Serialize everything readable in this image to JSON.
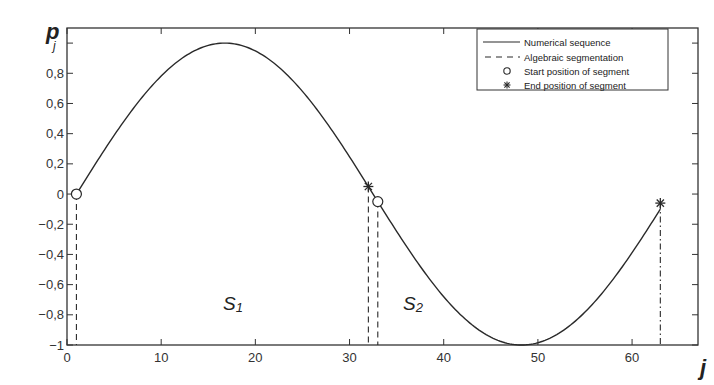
{
  "chart_data": {
    "type": "line",
    "title": "",
    "xlabel": "j",
    "ylabel": "p_j",
    "xlim": [
      0,
      67
    ],
    "ylim": [
      -1,
      1.1
    ],
    "grid": false,
    "legend_position": "upper right",
    "x_ticks": [
      0,
      10,
      20,
      30,
      40,
      50,
      60
    ],
    "x_tick_labels": [
      "0",
      "10",
      "20",
      "30",
      "40",
      "50",
      "60"
    ],
    "y_ticks": [
      -1,
      -0.8,
      -0.6,
      -0.4,
      -0.2,
      0,
      0.2,
      0.4,
      0.6,
      0.8,
      1
    ],
    "y_tick_labels": [
      "−1",
      "−0,8",
      "−0,6",
      "−0,4",
      "−0,2",
      "0",
      "0,2",
      "0,4",
      "0,6",
      "0,8",
      ""
    ],
    "series": [
      {
        "name": "Numerical sequence",
        "style": "solid",
        "formula": "p = sin(2*pi*(j-1)/63)",
        "x": [
          1,
          5,
          9,
          13,
          16.75,
          21,
          25,
          29,
          32,
          33,
          37,
          41,
          45,
          48.25,
          52,
          56,
          60,
          63
        ],
        "values": [
          0,
          0.39,
          0.72,
          0.94,
          1.0,
          0.91,
          0.68,
          0.34,
          0.05,
          -0.05,
          -0.44,
          -0.76,
          -0.95,
          -1.0,
          -0.92,
          -0.66,
          -0.32,
          -0.06
        ]
      },
      {
        "name": "Algebraic segmentation",
        "style": "dashed",
        "x": [
          1,
          32,
          33,
          63
        ],
        "values": [
          0,
          0.05,
          -0.05,
          -0.06
        ]
      },
      {
        "name": "Start position of segment",
        "marker": "circle",
        "x": [
          1,
          33
        ],
        "values": [
          0,
          -0.05
        ]
      },
      {
        "name": "End position of segment",
        "marker": "asterisk",
        "x": [
          32,
          63
        ],
        "values": [
          0.05,
          -0.06
        ]
      }
    ],
    "annotations": [
      {
        "text": "S1",
        "x": 17,
        "y": -0.7
      },
      {
        "text": "S2",
        "x": 37,
        "y": -0.7
      }
    ]
  },
  "labels": {
    "y_axis_main": "p",
    "y_axis_sub": "j",
    "x_axis": "j",
    "segment1_main": "S",
    "segment1_sub": "1",
    "segment2_main": "S",
    "segment2_sub": "2"
  },
  "legend": {
    "items": [
      {
        "label": "Numerical sequence",
        "symbol": "solid-line"
      },
      {
        "label": "Algebraic segmentation",
        "symbol": "dashed-line"
      },
      {
        "label": "Start position of segment",
        "symbol": "circle"
      },
      {
        "label": "End position of segment",
        "symbol": "asterisk"
      }
    ]
  },
  "colors": {
    "line": "#2a2a2a",
    "axis": "#333333",
    "background": "#ffffff"
  }
}
